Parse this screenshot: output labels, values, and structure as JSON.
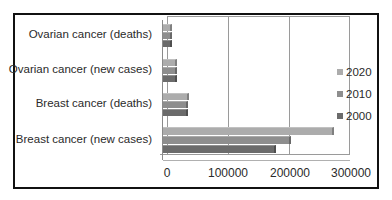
{
  "chart_data": {
    "type": "bar",
    "orientation": "horizontal",
    "style": "3d-clustered",
    "title": "",
    "xlabel": "",
    "ylabel": "",
    "categories": [
      "Breast cancer (new cases)",
      "Breast cancer (deaths)",
      "Ovarian cancer (new cases)",
      "Ovarian cancer (deaths)"
    ],
    "series": [
      {
        "name": "2000",
        "color": "#6b6b6b",
        "values": [
          182000,
          41000,
          23000,
          14000
        ]
      },
      {
        "name": "2010",
        "color": "#8e8e8e",
        "values": [
          207000,
          40000,
          22000,
          14000
        ]
      },
      {
        "name": "2020",
        "color": "#acacac",
        "values": [
          276000,
          42000,
          22000,
          14000
        ]
      }
    ],
    "xlim": [
      0,
      300000
    ],
    "xticks": [
      "0",
      "100000",
      "200000",
      "300000"
    ],
    "grid": true,
    "legend_position": "right",
    "legend_order": [
      "2020",
      "2010",
      "2000"
    ]
  }
}
